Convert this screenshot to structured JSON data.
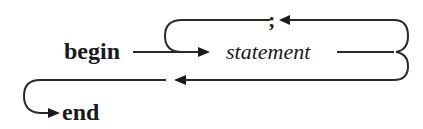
{
  "diagram": {
    "type": "syntax-diagram",
    "start_keyword": "begin",
    "nonterminal": "statement",
    "separator": ";",
    "end_keyword": "end"
  }
}
